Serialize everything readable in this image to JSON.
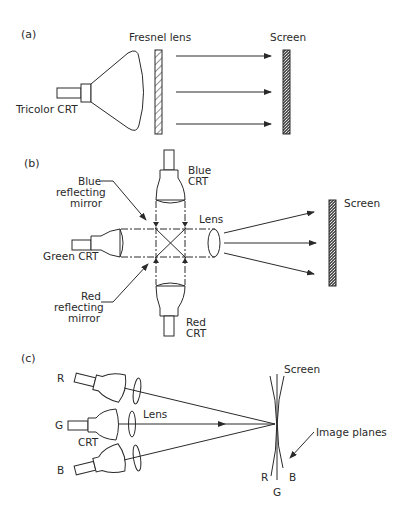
{
  "figure": {
    "colors": {
      "ink": "#2a2a2a",
      "background": "#ffffff"
    },
    "panels": [
      {
        "id": "a",
        "label": "(a)",
        "labels": {
          "crt": "Tricolor CRT",
          "lens": "Fresnel lens",
          "screen": "Screen"
        }
      },
      {
        "id": "b",
        "label": "(b)",
        "labels": {
          "blue_crt_line1": "Blue",
          "blue_crt_line2": "CRT",
          "blue_mirror_line1": "Blue",
          "blue_mirror_line2": "reflecting",
          "blue_mirror_line3": "mirror",
          "green_crt": "Green  CRT",
          "lens": "Lens",
          "red_mirror_line1": "Red",
          "red_mirror_line2": "reflecting",
          "red_mirror_line3": "mirror",
          "red_crt_line1": "Red",
          "red_crt_line2": "CRT",
          "screen": "Screen"
        }
      },
      {
        "id": "c",
        "label": "(c)",
        "labels": {
          "r": "R",
          "g": "G",
          "b": "B",
          "crt": "CRT",
          "lens": "Lens",
          "screen": "Screen",
          "image_planes": "Image planes",
          "plane_r": "R",
          "plane_g": "G",
          "plane_b": "B"
        }
      }
    ]
  }
}
